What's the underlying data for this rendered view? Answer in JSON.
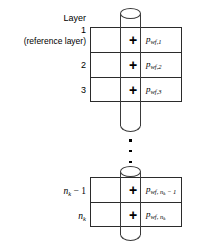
{
  "diagram": {
    "header_label": "Layer",
    "wellbore_name": "wellbore-cylinder",
    "marker_glyph": "+",
    "ellipsis_glyph": "vertical-ellipsis",
    "colors": {
      "line": "#2b2b2b",
      "cylinder_line": "#3a3a3a",
      "text": "#000000",
      "background": "#ffffff"
    }
  },
  "layers": [
    {
      "id": "layer-1",
      "number": "1",
      "note": "(reference layer)",
      "marker": "+",
      "pressure_symbol": "p",
      "pressure_sub": "wf,1",
      "pressure_full": "p wf,1"
    },
    {
      "id": "layer-2",
      "number": "2",
      "note": "",
      "marker": "+",
      "pressure_symbol": "p",
      "pressure_sub": "wf,2",
      "pressure_full": "p wf,2"
    },
    {
      "id": "layer-3",
      "number": "3",
      "note": "",
      "marker": "+",
      "pressure_symbol": "p",
      "pressure_sub": "wf,3",
      "pressure_full": "p wf,3"
    },
    {
      "id": "layer-nk-minus-1",
      "number": "n_k − 1",
      "number_base": "n",
      "number_sub": "k",
      "number_op": " − 1",
      "note": "",
      "marker": "+",
      "pressure_symbol": "p",
      "pressure_sub": "wf, n_k−1",
      "pressure_full": "p wf, n_k−1"
    },
    {
      "id": "layer-nk",
      "number": "n_k",
      "number_base": "n",
      "number_sub": "k",
      "number_op": "",
      "note": "",
      "marker": "+",
      "pressure_symbol": "p",
      "pressure_sub": "wf, n_k",
      "pressure_full": "p wf, n_k"
    }
  ],
  "labels": {
    "layer_word": "Layer",
    "one": "1",
    "reference": "(reference layer)",
    "two": "2",
    "three": "3",
    "p": "p",
    "sub_wf1": "wf,1",
    "sub_wf2": "wf,2",
    "sub_wf3": "wf,3",
    "sub_wf_prefix": "wf, ",
    "n": "n",
    "k": "k",
    "minus_one": " − 1"
  }
}
